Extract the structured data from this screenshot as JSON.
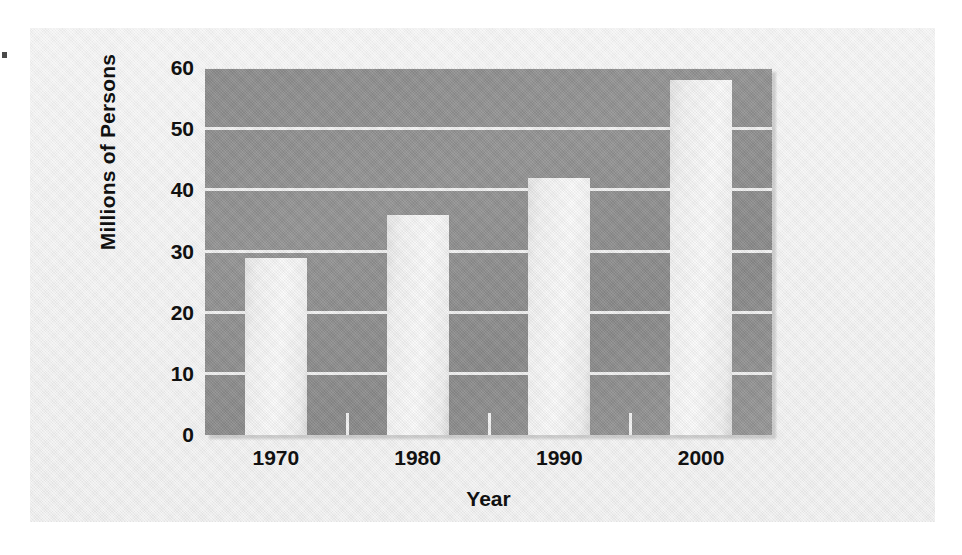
{
  "chart_data": {
    "type": "bar",
    "title": "",
    "categories": [
      "1970",
      "1980",
      "1990",
      "2000"
    ],
    "values": [
      29,
      36,
      42,
      58
    ],
    "xlabel": "Year",
    "ylabel": "Millions of Persons",
    "ylim": [
      0,
      60
    ],
    "yticks": [
      "0",
      "10",
      "20",
      "30",
      "40",
      "50",
      "60"
    ],
    "ytick_values": [
      0,
      10,
      20,
      30,
      40,
      50,
      60
    ],
    "grid": "horizontal-white-gridlines",
    "legend": "none",
    "series": [
      {
        "name": "Millions of Persons",
        "values": [
          29,
          36,
          42,
          58
        ]
      }
    ]
  },
  "colors": {
    "page_background": "#ffffff",
    "panel_background": "#ececec",
    "plot_background": "#919191",
    "gridline": "#f2f2f2",
    "bar_fill": "#f7f7f7",
    "text": "#111111"
  }
}
